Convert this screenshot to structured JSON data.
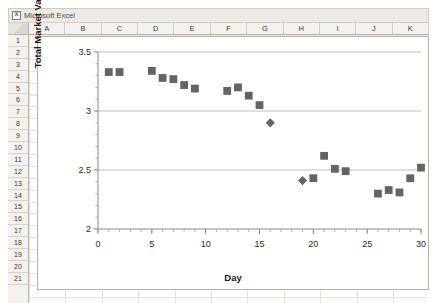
{
  "window": {
    "title": "Microsoft Excel",
    "icon": "excel-icon"
  },
  "spreadsheet": {
    "columns": [
      "A",
      "B",
      "C",
      "D",
      "E",
      "F",
      "G",
      "H",
      "I",
      "J",
      "K"
    ],
    "rows": [
      "1",
      "2",
      "3",
      "4",
      "5",
      "6",
      "7",
      "8",
      "9",
      "10",
      "11",
      "12",
      "13",
      "14",
      "15",
      "16",
      "17",
      "18",
      "19",
      "20",
      "21"
    ]
  },
  "chart_data": {
    "type": "scatter",
    "title": "",
    "xlabel": "Day",
    "ylabel": "Total Market Value ($ trillion)",
    "xlim": [
      0,
      30
    ],
    "ylim": [
      2,
      3.5
    ],
    "xticks": [
      0,
      5,
      10,
      15,
      20,
      25,
      30
    ],
    "yticks": [
      2,
      2.5,
      3,
      3.5
    ],
    "xtick_labels": [
      "0",
      "5",
      "10",
      "15",
      "20",
      "25",
      "30"
    ],
    "ytick_labels": [
      "2",
      "2.5",
      "3",
      "3.5"
    ],
    "grid": true,
    "legend": false,
    "marker_color": "#646464",
    "series": [
      {
        "name": "Total Market Value",
        "marker": "square",
        "points": [
          {
            "x": 1,
            "y": 3.33
          },
          {
            "x": 2,
            "y": 3.33
          },
          {
            "x": 5,
            "y": 3.34
          },
          {
            "x": 6,
            "y": 3.28
          },
          {
            "x": 7,
            "y": 3.27
          },
          {
            "x": 8,
            "y": 3.22
          },
          {
            "x": 9,
            "y": 3.19
          },
          {
            "x": 12,
            "y": 3.17
          },
          {
            "x": 13,
            "y": 3.2
          },
          {
            "x": 14,
            "y": 3.13
          },
          {
            "x": 15,
            "y": 3.05
          },
          {
            "x": 20,
            "y": 2.43
          },
          {
            "x": 21,
            "y": 2.62
          },
          {
            "x": 22,
            "y": 2.51
          },
          {
            "x": 23,
            "y": 2.49
          },
          {
            "x": 26,
            "y": 2.3
          },
          {
            "x": 27,
            "y": 2.33
          },
          {
            "x": 28,
            "y": 2.31
          },
          {
            "x": 29,
            "y": 2.43
          },
          {
            "x": 30,
            "y": 2.52
          }
        ]
      },
      {
        "name": "Highlighted days",
        "marker": "diamond",
        "points": [
          {
            "x": 16,
            "y": 2.9
          },
          {
            "x": 19,
            "y": 2.41
          }
        ]
      }
    ]
  }
}
